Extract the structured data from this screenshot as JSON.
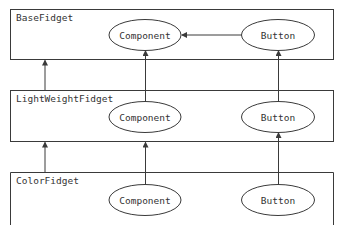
{
  "diagram": {
    "colors": {
      "stroke": "#3a3a3a",
      "text": "#333333",
      "background": "#ffffff"
    },
    "layers": [
      {
        "id": "base",
        "label": "BaseFidget",
        "nodes": [
          {
            "id": "base-component",
            "label": "Component"
          },
          {
            "id": "base-button",
            "label": "Button"
          }
        ]
      },
      {
        "id": "lightweight",
        "label": "LightWeightFidget",
        "nodes": [
          {
            "id": "lw-component",
            "label": "Component"
          },
          {
            "id": "lw-button",
            "label": "Button"
          }
        ]
      },
      {
        "id": "color",
        "label": "ColorFidget",
        "nodes": [
          {
            "id": "color-component",
            "label": "Component"
          },
          {
            "id": "color-button",
            "label": "Button"
          }
        ]
      }
    ],
    "edges": [
      {
        "from": "base-button",
        "to": "base-component"
      },
      {
        "from": "lightweight",
        "to": "base"
      },
      {
        "from": "lw-component",
        "to": "base"
      },
      {
        "from": "lw-button",
        "to": "base-button"
      },
      {
        "from": "color",
        "to": "lightweight"
      },
      {
        "from": "color-component",
        "to": "lightweight"
      },
      {
        "from": "color-button",
        "to": "lw-button"
      }
    ]
  }
}
